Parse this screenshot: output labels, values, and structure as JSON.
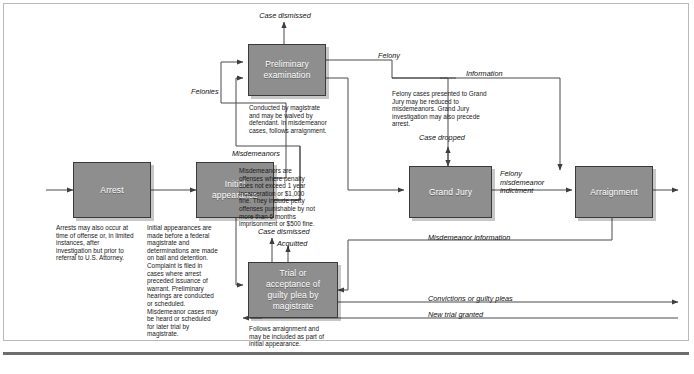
{
  "figure": {
    "type": "flowchart"
  },
  "nodes": {
    "arrest": {
      "label": "Arrest"
    },
    "initial_appearance": {
      "label": "Initial\nappearance"
    },
    "preliminary_examination": {
      "label": "Preliminary\nexamination"
    },
    "grand_jury": {
      "label": "Grand Jury"
    },
    "arraignment": {
      "label": "Arraignment"
    },
    "trial": {
      "label": "Trial or\nacceptance of\nguilty plea by\nmagistrate"
    }
  },
  "captions": {
    "arrest": "Arrests may also occur at time of offense or, in limited instances, after investigation but prior to referral to U.S. Attorney.",
    "initial_appearance": "Initial appearances are made before a federal magistrate and determinations are made on bail and detention. Complaint is filed in cases where arrest preceded issuance of warrant. Preliminary hearings are conducted or scheduled. Misdemeanor cases may be heard or scheduled for later trial by magistrate.",
    "preliminary_examination": "Conducted by magistrate and may be waived by defendant. In misdemeanor cases, follows arraignment.",
    "misdemeanors": "Misdemeanors are offenses where penalty does not exceed 1 year incarceration or $1,000 fine. They include petty offenses punishable by not more than 6 months imprisonment or $500 fine.",
    "grand_jury": "Felony cases presented to Grand Jury may be reduced to misdemeanors. Grand Jury investigation may also precede arrest.",
    "trial": "Follows arraignment and may be included as part of initial appearance."
  },
  "edge_labels": {
    "case_dismissed_top": "Case dismissed",
    "felonies": "Felonies",
    "misdemeanors": "Misdemeanors",
    "felony": "Felony",
    "information": "Information",
    "case_dropped": "Case dropped",
    "felony_misdemeanor_indictment": "Felony\nmisdemeanor\nindictment",
    "case_dismissed_trial": "Case dismissed",
    "acquitted": "Acquitted",
    "misdemeanor_information": "Misdemeanor information",
    "convictions_or_guilty_pleas": "Convictions or guilty pleas",
    "new_trial_granted": "New trial granted"
  },
  "colors": {
    "box_fill": "#8e8e8e",
    "box_stroke": "#3a3a3a",
    "box_text": "#ffffff",
    "line": "#4a4a4a",
    "frame": "#b9b9b9",
    "rule": "#6d6d6d"
  }
}
